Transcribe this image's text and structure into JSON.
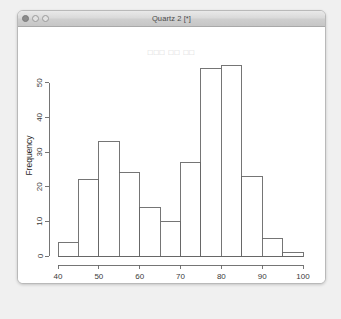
{
  "window": {
    "title": "Quartz 2 [*]",
    "controls": [
      {
        "name": "close",
        "label": ""
      },
      {
        "name": "minimize",
        "label": ""
      },
      {
        "name": "zoom",
        "label": ""
      }
    ]
  },
  "chart_data": {
    "type": "bar",
    "title": "□□□ □□ □□",
    "xlabel": "faithful$waiting",
    "ylabel": "Frequency",
    "categories": [
      "40-45",
      "45-50",
      "50-55",
      "55-60",
      "60-65",
      "65-70",
      "70-75",
      "75-80",
      "80-85",
      "85-90",
      "90-95",
      "95-100"
    ],
    "bin_edges": [
      40,
      45,
      50,
      55,
      60,
      65,
      70,
      75,
      80,
      85,
      90,
      95,
      100
    ],
    "values": [
      4,
      22,
      33,
      24,
      14,
      10,
      27,
      54,
      55,
      23,
      5,
      1
    ],
    "xticks": [
      40,
      50,
      60,
      70,
      80,
      90,
      100
    ],
    "yticks": [
      0,
      10,
      20,
      30,
      40,
      50
    ],
    "xlim": [
      40,
      100
    ],
    "ylim": [
      0,
      58
    ],
    "grid": false,
    "legend": false,
    "bar_fill": "#ffffff",
    "bar_stroke": "#666666",
    "axis_color": "#666666"
  }
}
